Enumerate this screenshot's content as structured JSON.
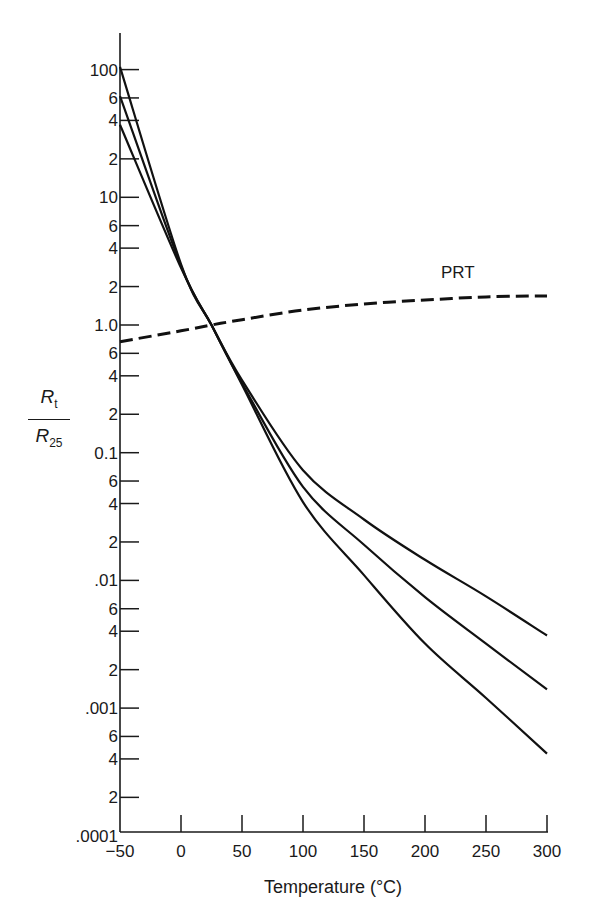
{
  "chart_data": {
    "type": "line",
    "title": "",
    "xlabel": "Temperature (°C)",
    "ylabel": "R_t / R_25",
    "ylabel_parts": {
      "numerator": "R",
      "numerator_sub": "t",
      "denominator": "R",
      "denominator_sub": "25"
    },
    "xlim": [
      -50,
      300
    ],
    "ylim": [
      0.0001,
      200
    ],
    "yscale": "log",
    "grid": false,
    "legend": "none (inline label on PRT curve)",
    "x_ticks": [
      -50,
      0,
      50,
      100,
      150,
      200,
      250,
      300
    ],
    "x_tick_labels": [
      "−50",
      "0",
      "50",
      "100",
      "150",
      "200",
      "250",
      "300"
    ],
    "y_ticks": [
      {
        "value": 100,
        "label": "100"
      },
      {
        "value": 60,
        "label": "6"
      },
      {
        "value": 40,
        "label": "4"
      },
      {
        "value": 20,
        "label": "2"
      },
      {
        "value": 10,
        "label": "10"
      },
      {
        "value": 6,
        "label": "6"
      },
      {
        "value": 4,
        "label": "4"
      },
      {
        "value": 2,
        "label": "2"
      },
      {
        "value": 1,
        "label": "1.0"
      },
      {
        "value": 0.6,
        "label": "6"
      },
      {
        "value": 0.4,
        "label": "4"
      },
      {
        "value": 0.2,
        "label": "2"
      },
      {
        "value": 0.1,
        "label": "0.1"
      },
      {
        "value": 0.06,
        "label": "6"
      },
      {
        "value": 0.04,
        "label": "4"
      },
      {
        "value": 0.02,
        "label": "2"
      },
      {
        "value": 0.01,
        "label": ".01"
      },
      {
        "value": 0.006,
        "label": "6"
      },
      {
        "value": 0.004,
        "label": "4"
      },
      {
        "value": 0.002,
        "label": "2"
      },
      {
        "value": 0.001,
        "label": ".001"
      },
      {
        "value": 0.0006,
        "label": "6"
      },
      {
        "value": 0.0004,
        "label": "4"
      },
      {
        "value": 0.0002,
        "label": "2"
      },
      {
        "value": 0.0001,
        "label": ".0001"
      }
    ],
    "x": [
      -50,
      0,
      25,
      50,
      100,
      150,
      200,
      250,
      300
    ],
    "series": [
      {
        "name": "Thermistor A (flattest)",
        "style": "solid",
        "values": [
          37,
          2.8,
          1.0,
          0.37,
          0.073,
          0.03,
          0.0145,
          0.0075,
          0.0037
        ]
      },
      {
        "name": "Thermistor B",
        "style": "solid",
        "values": [
          62,
          2.9,
          1.0,
          0.35,
          0.054,
          0.019,
          0.0074,
          0.0032,
          0.0014
        ]
      },
      {
        "name": "Thermistor C (steepest)",
        "style": "solid",
        "values": [
          105,
          3.0,
          1.0,
          0.34,
          0.041,
          0.011,
          0.0032,
          0.0012,
          0.00044
        ]
      },
      {
        "name": "PRT",
        "style": "dashed",
        "label": "PRT",
        "values": [
          0.74,
          0.9,
          1.0,
          1.1,
          1.31,
          1.46,
          1.57,
          1.66,
          1.69
        ]
      }
    ],
    "annotations": [
      {
        "text": "PRT",
        "x": 250,
        "y": 2.5
      }
    ]
  }
}
